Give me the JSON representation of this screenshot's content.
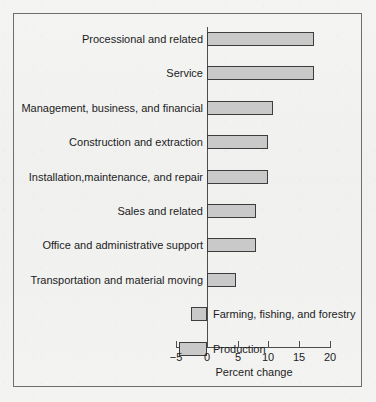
{
  "chart_data": {
    "type": "bar",
    "orientation": "horizontal",
    "title": "",
    "xlabel": "Percent change",
    "ylabel": "",
    "xlim": [
      -5,
      20
    ],
    "xticks": [
      -5,
      0,
      5,
      10,
      15,
      20
    ],
    "xtick_labels": [
      "−5",
      "0",
      "5",
      "10",
      "15",
      "20"
    ],
    "grid": false,
    "legend": null,
    "categories": [
      "Processional and related",
      "Service",
      "Management, business, and financial",
      "Construction and extraction",
      "Installation,maintenance, and repair",
      "Sales and related",
      "Office and administrative support",
      "Transportation and material moving",
      "Farming, fishing, and forestry",
      "Production"
    ],
    "values": [
      17.4,
      17.4,
      10.7,
      10.0,
      10.0,
      8.0,
      8.0,
      4.7,
      -2.6,
      -4.6
    ],
    "bar_color": "#c9c9c9",
    "bar_edge_color": "#3d3d3d"
  },
  "axis": {
    "title": "Percent change",
    "ticks": [
      {
        "value": -5,
        "label": "−5"
      },
      {
        "value": 0,
        "label": "0"
      },
      {
        "value": 5,
        "label": "5"
      },
      {
        "value": 10,
        "label": "10"
      },
      {
        "value": 15,
        "label": "15"
      },
      {
        "value": 20,
        "label": "20"
      }
    ]
  },
  "bars": [
    {
      "label": "Processional and related",
      "value": 17.4,
      "label_side": "left"
    },
    {
      "label": "Service",
      "value": 17.4,
      "label_side": "left"
    },
    {
      "label": "Management, business, and financial",
      "value": 10.7,
      "label_side": "left"
    },
    {
      "label": "Construction and extraction",
      "value": 10.0,
      "label_side": "left"
    },
    {
      "label": "Installation,maintenance, and repair",
      "value": 10.0,
      "label_side": "left"
    },
    {
      "label": "Sales and related",
      "value": 8.0,
      "label_side": "left"
    },
    {
      "label": "Office and administrative support",
      "value": 8.0,
      "label_side": "left"
    },
    {
      "label": "Transportation and material moving",
      "value": 4.7,
      "label_side": "left"
    },
    {
      "label": "Farming, fishing, and forestry",
      "value": -2.6,
      "label_side": "right"
    },
    {
      "label": "Production",
      "value": -4.6,
      "label_side": "right"
    }
  ],
  "colors": {
    "bar_fill": "#c9c9c9",
    "bar_edge": "#3d3d3d",
    "axis": "#4d4d4d",
    "frame": "#6e6e6e",
    "background": "#f2f2f1",
    "text": "#1c1c1c"
  }
}
